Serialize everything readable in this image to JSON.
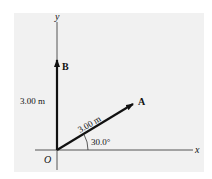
{
  "diagram": {
    "axes": {
      "x_label": "x",
      "y_label": "y",
      "origin_label": "O"
    },
    "vectors": [
      {
        "name": "A",
        "magnitude_label": "3.00 m",
        "angle_deg": 30.0
      },
      {
        "name": "B",
        "magnitude_label": "3.00 m",
        "angle_deg": 90.0
      }
    ],
    "angle_label": "30.0°",
    "colors": {
      "background": "#f1f1f1",
      "vector": "#111111",
      "axis": "#555555"
    }
  }
}
